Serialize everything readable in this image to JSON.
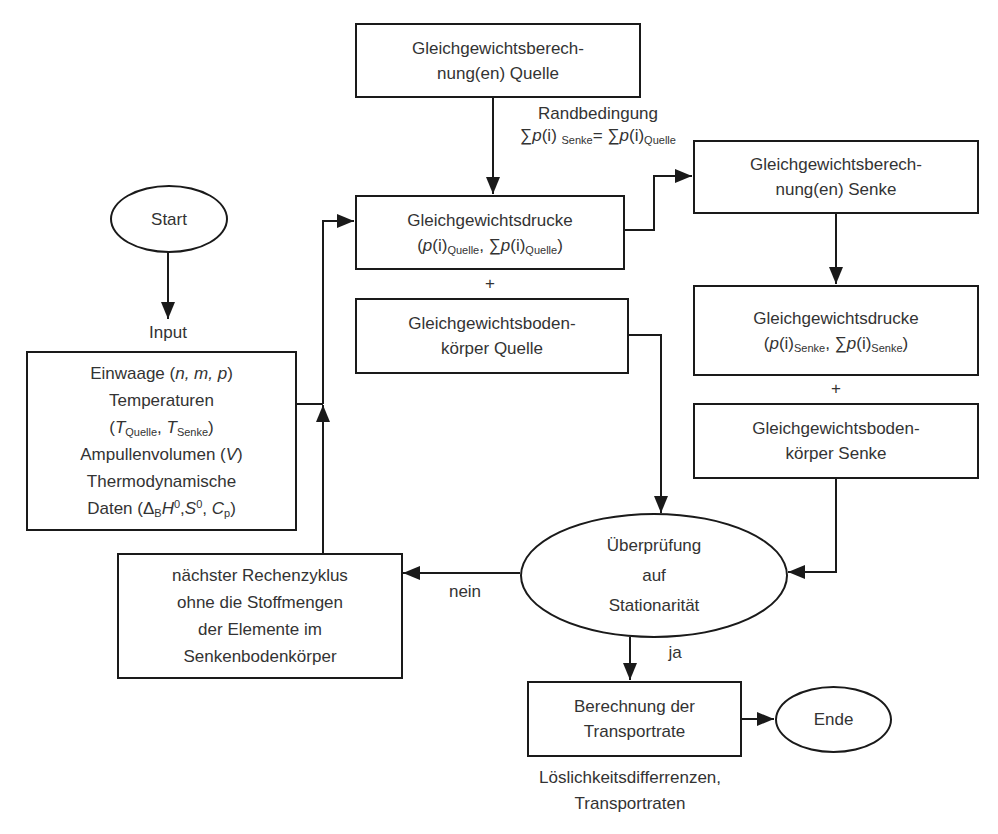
{
  "diagram": {
    "type": "flowchart",
    "language": "de",
    "colors": {
      "stroke": "#1a1a1a",
      "text": "#333333",
      "background": "#ffffff"
    }
  },
  "nodes": {
    "start": {
      "shape": "ellipse",
      "label": "Start"
    },
    "input_label": "Input",
    "input": {
      "shape": "rect",
      "lines": {
        "l1_text": "Einwaage (",
        "l1_vars": "n, m, p",
        "l1_end": ")",
        "l2": "Temperaturen",
        "l3_open": "(",
        "l3_T1": "T",
        "l3_sub1": "Quelle",
        "l3_sep": ", ",
        "l3_T2": "T",
        "l3_sub2": "Senke",
        "l3_close": ")",
        "l4_text": "Ampullenvolumen (",
        "l4_var": "V",
        "l4_end": ")",
        "l5": "Thermodynamische",
        "l6_text": "Daten (Δ",
        "l6_subB": "B",
        "l6_H": "H",
        "l6_sup0a": "0",
        "l6_comma1": ",",
        "l6_S": "S",
        "l6_sup0b": "0",
        "l6_comma2": ", ",
        "l6_C": "C",
        "l6_subp": "p",
        "l6_end": ")"
      }
    },
    "eq_calc_source": {
      "shape": "rect",
      "line1": "Gleichgewichtsberech-",
      "line2": "nung(en) Quelle"
    },
    "boundary_condition": {
      "title": "Randbedingung",
      "sum1": "∑",
      "p1": "p",
      "i1": "(i)",
      "sub1": "Senke",
      "eq": "= ",
      "sum2": "∑",
      "p2": "p",
      "i2": "(i)",
      "sub2": "Quelle"
    },
    "eq_pressure_source": {
      "shape": "rect",
      "line1": "Gleichgewichtsdrucke",
      "open": "(",
      "p1": "p",
      "i1": "(i)",
      "sub1": "Quelle",
      "sep": ", ",
      "sum": "∑",
      "p2": "p",
      "i2": "(i)",
      "sub2": "Quelle",
      "close": ")"
    },
    "plus_source": "+",
    "eq_solid_source": {
      "shape": "rect",
      "line1": "Gleichgewichtsboden-",
      "line2": "körper Quelle"
    },
    "eq_calc_sink": {
      "shape": "rect",
      "line1": "Gleichgewichtsberech-",
      "line2": "nung(en) Senke"
    },
    "eq_pressure_sink": {
      "shape": "rect",
      "line1": "Gleichgewichtsdrucke",
      "open": "(",
      "p1": "p",
      "i1": "(i)",
      "sub1": "Senke",
      "sep": ", ",
      "sum": "∑",
      "p2": "p",
      "i2": "(i)",
      "sub2": "Senke",
      "close": ")"
    },
    "plus_sink": "+",
    "eq_solid_sink": {
      "shape": "rect",
      "line1": "Gleichgewichtsboden-",
      "line2": "körper Senke"
    },
    "check": {
      "shape": "ellipse",
      "line1": "Überprüfung",
      "line2": "auf",
      "line3": "Stationarität"
    },
    "next_cycle": {
      "shape": "rect",
      "line1": "nächster Rechenzyklus",
      "line2": "ohne die Stoffmengen",
      "line3": "der Elemente im",
      "line4": "Senkenbodenkörper"
    },
    "calc_rate": {
      "shape": "rect",
      "line1": "Berechnung der",
      "line2": "Transportrate"
    },
    "end": {
      "shape": "ellipse",
      "label": "Ende"
    },
    "output_label": {
      "line1": "Löslichkeitsdifferrenzen,",
      "line2": "Transportraten"
    }
  },
  "edges": [
    {
      "from": "start",
      "to": "input",
      "label": ""
    },
    {
      "from": "input",
      "to": "eq_pressure_source",
      "label": ""
    },
    {
      "from": "eq_calc_source",
      "to": "eq_pressure_source",
      "label": "Randbedingung"
    },
    {
      "from": "eq_pressure_source",
      "to": "eq_calc_sink",
      "label": ""
    },
    {
      "from": "eq_calc_sink",
      "to": "eq_pressure_sink",
      "label": ""
    },
    {
      "from": "eq_solid_source",
      "to": "check",
      "label": ""
    },
    {
      "from": "eq_solid_sink",
      "to": "check",
      "label": ""
    },
    {
      "from": "check",
      "to": "next_cycle",
      "label": "nein"
    },
    {
      "from": "next_cycle",
      "to": "eq_pressure_source",
      "label": ""
    },
    {
      "from": "check",
      "to": "calc_rate",
      "label": "ja"
    },
    {
      "from": "calc_rate",
      "to": "end",
      "label": ""
    }
  ],
  "edge_labels": {
    "no": "nein",
    "yes": "ja"
  }
}
